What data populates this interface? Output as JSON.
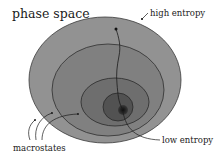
{
  "diagram": {
    "title": "phase space",
    "labels": {
      "high": "high entropy",
      "low": "low entropy",
      "macrostates": "macrostates"
    },
    "regions": [
      {
        "name": "macrostate-1",
        "cx": 105,
        "cy": 80,
        "rx": 76,
        "ry": 63,
        "fill": "#929292"
      },
      {
        "name": "macrostate-2",
        "cx": 108,
        "cy": 90,
        "rx": 56,
        "ry": 46,
        "fill": "#808080"
      },
      {
        "name": "macrostate-3",
        "cx": 115,
        "cy": 102,
        "rx": 34,
        "ry": 24,
        "fill": "#6e6e6e"
      },
      {
        "name": "macrostate-4",
        "cx": 118,
        "cy": 107,
        "rx": 15,
        "ry": 14,
        "fill": "#525252"
      },
      {
        "name": "core",
        "cx": 123,
        "cy": 110,
        "rx": 5,
        "ry": 5,
        "fill": "#1e1e1e"
      }
    ],
    "colors": {
      "background": "#ffffff",
      "stroke": "#2a2a2a",
      "text": "#1a1a1a"
    }
  }
}
